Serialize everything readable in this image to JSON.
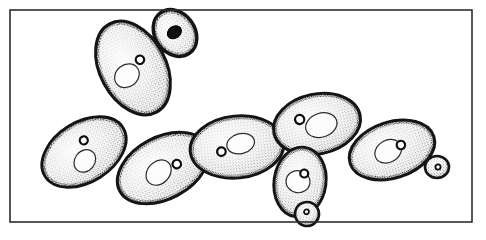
{
  "figure": {
    "technique": "stipple ink drawing",
    "background_color": "#ffffff",
    "ink_color": "#1a1a1a",
    "caption": "",
    "frame": {
      "name": "illustration-border",
      "x": 10,
      "y": 10,
      "width": 462,
      "height": 212,
      "stroke_width": 1.6,
      "color": "#2e2e2e"
    },
    "canvas": {
      "width": 486,
      "height": 240
    },
    "cells": [
      {
        "id": "cell-mother-upper-left",
        "label": "large mother cell, upper left",
        "cx": 133,
        "cy": 68,
        "rx": 33,
        "ry": 50,
        "rotation": -28,
        "stroke_width": 3.0,
        "organelles": [
          {
            "type": "vacuole-ring",
            "cx": -9,
            "cy": 4,
            "rx": 13,
            "ry": 11,
            "rotation": -10
          },
          {
            "type": "nucleus-dot",
            "cx": 10,
            "cy": -4,
            "r": 4.2
          }
        ]
      },
      {
        "id": "cell-bud-upper-right",
        "label": "small bud on upper-left mother",
        "cx": 175,
        "cy": 33,
        "rx": 20,
        "ry": 25,
        "rotation": -36,
        "stroke_width": 3.4,
        "organelles": [
          {
            "type": "nucleus-dark",
            "cx": 0,
            "cy": -1,
            "rx": 7.5,
            "ry": 6
          }
        ]
      },
      {
        "id": "cell-left-lower",
        "label": "left lower cell",
        "cx": 84,
        "cy": 152,
        "rx": 46,
        "ry": 30,
        "rotation": -32,
        "stroke_width": 2.8,
        "organelles": [
          {
            "type": "vacuole-ring",
            "cx": -4,
            "cy": 8,
            "rx": 12,
            "ry": 10,
            "rotation": -20
          },
          {
            "type": "nucleus-dot",
            "cx": 6,
            "cy": -10,
            "r": 4.0
          }
        ]
      },
      {
        "id": "cell-center-lower",
        "label": "center lower cell",
        "cx": 163,
        "cy": 168,
        "rx": 49,
        "ry": 31,
        "rotation": -28,
        "stroke_width": 2.9,
        "organelles": [
          {
            "type": "vacuole-ring",
            "cx": -6,
            "cy": 2,
            "rx": 14,
            "ry": 11,
            "rotation": -18
          },
          {
            "type": "nucleus-dot",
            "cx": 14,
            "cy": 3,
            "r": 4.2
          }
        ]
      },
      {
        "id": "cell-center-right",
        "label": "central horizontal cell",
        "cx": 237,
        "cy": 147,
        "rx": 47,
        "ry": 31,
        "rotation": -6,
        "stroke_width": 2.9,
        "organelles": [
          {
            "type": "vacuole-ring",
            "cx": 4,
            "cy": -3,
            "rx": 14,
            "ry": 10,
            "rotation": -8
          },
          {
            "type": "nucleus-dot",
            "cx": -16,
            "cy": 3,
            "r": 4.3
          }
        ]
      },
      {
        "id": "cell-upper-right-cluster",
        "label": "upper right cluster cell",
        "cx": 317,
        "cy": 124,
        "rx": 44,
        "ry": 30,
        "rotation": -12,
        "stroke_width": 3.0,
        "organelles": [
          {
            "type": "vacuole-ring",
            "cx": 4,
            "cy": 2,
            "rx": 16,
            "ry": 12,
            "rotation": -6
          },
          {
            "type": "nucleus-dot",
            "cx": -16,
            "cy": -8,
            "r": 4.6
          }
        ]
      },
      {
        "id": "cell-lower-right-pendant",
        "label": "lower pendant cell with bud",
        "cx": 300,
        "cy": 182,
        "rx": 26,
        "ry": 35,
        "rotation": 8,
        "stroke_width": 2.9,
        "organelles": [
          {
            "type": "vacuole-ring",
            "cx": -2,
            "cy": 0,
            "rx": 12,
            "ry": 11,
            "rotation": 0
          },
          {
            "type": "nucleus-dot",
            "cx": 3,
            "cy": -9,
            "r": 4.0
          }
        ]
      },
      {
        "id": "cell-far-right",
        "label": "far right cell",
        "cx": 392,
        "cy": 150,
        "rx": 44,
        "ry": 28,
        "rotation": -18,
        "stroke_width": 3.0,
        "organelles": [
          {
            "type": "vacuole-ring",
            "cx": -4,
            "cy": 0,
            "rx": 14,
            "ry": 11,
            "rotation": -12
          },
          {
            "type": "nucleus-dot",
            "cx": 10,
            "cy": -2,
            "r": 4.2
          }
        ]
      }
    ],
    "buds": [
      {
        "id": "bud-far-right-tip",
        "label": "tiny bud at far right tip",
        "cx": 437,
        "cy": 167,
        "rx": 12,
        "ry": 11,
        "rotation": 0,
        "stroke_width": 2.6,
        "dot": {
          "cx": 1,
          "cy": 0,
          "r": 2.6
        }
      },
      {
        "id": "bud-pendant-bottom",
        "label": "small bud below pendant cell",
        "cx": 307,
        "cy": 214,
        "rx": 12,
        "ry": 12,
        "rotation": 14,
        "stroke_width": 2.6,
        "dot": {
          "cx": -1,
          "cy": -2,
          "r": 2.4
        }
      }
    ]
  }
}
